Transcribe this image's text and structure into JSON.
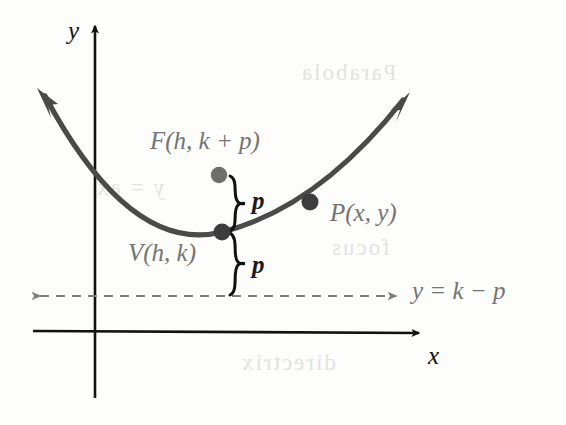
{
  "figure": {
    "colors": {
      "axis": "#121212",
      "curve": "#4a4a4a",
      "focus_dot": "#6e6e6e",
      "vertex_dot": "#3d3d3d",
      "point_dot": "#3d3d3d",
      "label_gray": "#737373",
      "brace": "#111111",
      "directrix": "#7d7d7d",
      "background": "#fdfdfc"
    }
  },
  "axes": {
    "x_label": "x",
    "y_label": "y",
    "origin": {
      "x": 94,
      "y": 333
    }
  },
  "curve": {
    "type": "parabola",
    "opens": "up",
    "vertex": {
      "x": 222,
      "y": 232
    },
    "left_arrow_tip": {
      "x": 37,
      "y": 88
    },
    "right_arrow_tip": {
      "x": 410,
      "y": 92
    }
  },
  "points": [
    {
      "name": "focus",
      "label": "F(h, k + p)",
      "dot": {
        "x": 219,
        "y": 175
      },
      "label_pos": {
        "x": 150,
        "y": 128
      }
    },
    {
      "name": "vertex",
      "label": "V(h, k)",
      "dot": {
        "x": 222,
        "y": 232
      },
      "label_pos": {
        "x": 128,
        "y": 240
      }
    },
    {
      "name": "point-p",
      "label": "P(x, y)",
      "dot": {
        "x": 310,
        "y": 202
      },
      "label_pos": {
        "x": 330,
        "y": 200
      }
    }
  ],
  "braces": [
    {
      "name": "focal-distance-upper",
      "label": "p",
      "top": 175,
      "bottom": 232,
      "label_pos": {
        "x": 252,
        "y": 190
      }
    },
    {
      "name": "directrix-distance-lower",
      "label": "p",
      "top": 232,
      "bottom": 296,
      "label_pos": {
        "x": 252,
        "y": 254
      }
    }
  ],
  "directrix": {
    "label": "y = k − p",
    "y": 296,
    "x_start": 33,
    "x_end": 400,
    "style": "dashed",
    "label_pos": {
      "x": 412,
      "y": 278
    }
  },
  "bleed_text": [
    {
      "text": "Parabola",
      "x": 300,
      "y": 60
    },
    {
      "text": "y = ax",
      "x": 95,
      "y": 175
    },
    {
      "text": "directrix",
      "x": 240,
      "y": 350
    },
    {
      "text": "focus",
      "x": 330,
      "y": 235
    }
  ]
}
